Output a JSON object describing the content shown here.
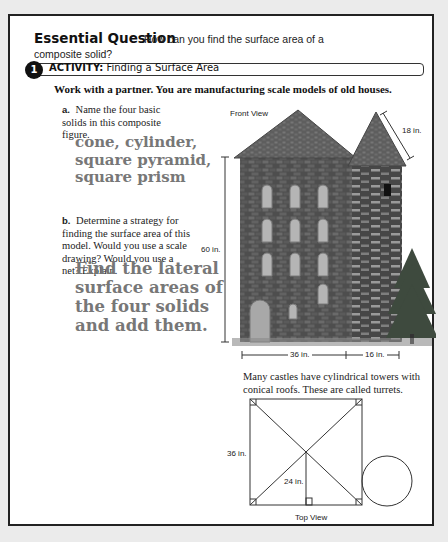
{
  "essential_question": {
    "title": "Essential Question",
    "question_line1": "How can you find the surface area of a",
    "question_line2": "composite solid?"
  },
  "activity": {
    "number": "1",
    "label_bold": "ACTIVITY:",
    "label_text": "Finding a Surface Area",
    "instruction": "Work with a partner. You are manufacturing scale models of old houses."
  },
  "part_a": {
    "label": "a.",
    "question": "Name the four basic solids in this composite figure.",
    "answer_lines": [
      "cone, cylinder,",
      "square pyramid,",
      "square prism"
    ]
  },
  "part_b": {
    "label": "b.",
    "question": "Determine a strategy for finding the surface area of this model. Would you use a scale drawing? Would you use a net? Explain.",
    "answer_lines": [
      "Find the lateral",
      "surface areas of",
      "the four solids",
      "and add them."
    ]
  },
  "front_view": {
    "title": "Front View",
    "height_label": "60 in.",
    "slant_label": "18 in.",
    "width_main_label": "36 in.",
    "width_tower_label": "16 in."
  },
  "caption": "Many castles have cylindrical towers with conical roofs. These are called turrets.",
  "top_view": {
    "title": "Top View",
    "side_label": "36 in.",
    "height_label": "24 in."
  },
  "colors": {
    "answer_gray": "#777777",
    "stone_dark": "#4a4a4a",
    "roof": "#6a6a6a",
    "window": "#b8b8b8"
  }
}
